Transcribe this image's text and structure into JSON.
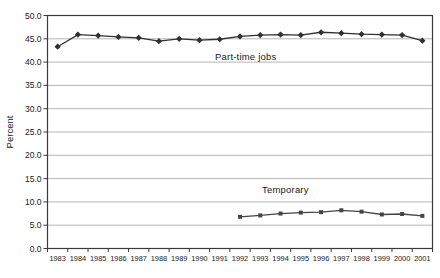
{
  "chart_data": {
    "type": "line",
    "title": "",
    "xlabel": "",
    "ylabel": "Percent",
    "ylim": [
      0,
      50
    ],
    "ytick_step": 5,
    "ytick_labels": [
      "0.0",
      "5.0",
      "10.0",
      "15.0",
      "20.0",
      "25.0",
      "30.0",
      "35.0",
      "40.0",
      "45.0",
      "50.0"
    ],
    "categories": [
      "1983",
      "1984",
      "1985",
      "1986",
      "1987",
      "1988",
      "1989",
      "1990",
      "1991",
      "1992",
      "1993",
      "1994",
      "1995",
      "1996",
      "1997",
      "1998",
      "1999",
      "2000",
      "2001"
    ],
    "grid": "horizontal",
    "legend": "none-inline-labels",
    "series": [
      {
        "name": "Part-time jobs",
        "marker": "diamond",
        "color": "#303030",
        "values": [
          43.3,
          45.9,
          45.7,
          45.4,
          45.2,
          44.5,
          45.0,
          44.7,
          44.9,
          45.5,
          45.8,
          45.9,
          45.8,
          46.4,
          46.2,
          46.0,
          45.9,
          45.8,
          44.6
        ]
      },
      {
        "name": "Temporary",
        "marker": "square",
        "color": "#454545",
        "values": [
          null,
          null,
          null,
          null,
          null,
          null,
          null,
          null,
          null,
          6.8,
          7.1,
          7.5,
          7.7,
          7.8,
          8.2,
          7.9,
          7.3,
          7.4,
          7.0
        ]
      }
    ],
    "annotations": [
      {
        "text": "Part-time jobs",
        "x": 215,
        "y": 51
      },
      {
        "text": "Temporary",
        "x": 262,
        "y": 184
      }
    ],
    "colors": {
      "gridline": "#b5b5b5",
      "axis": "#3a3a3a",
      "text": "#1a1a1a",
      "background": "#ffffff"
    }
  }
}
